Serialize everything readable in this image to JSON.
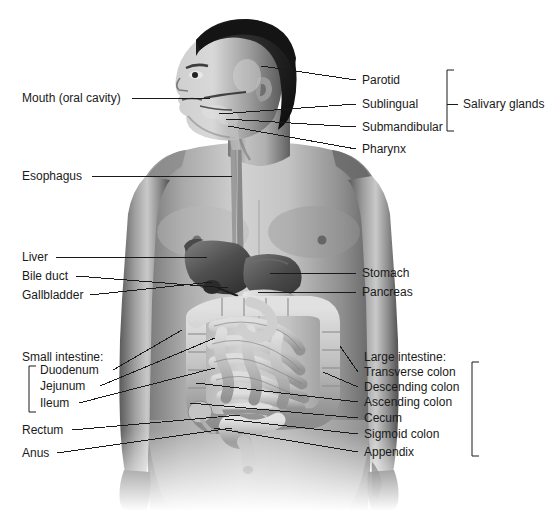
{
  "diagram": {
    "background_color": "#ffffff",
    "line_color": "#1a1a1a",
    "text_color": "#1a1a1a"
  },
  "labels_left": [
    {
      "id": "mouth",
      "text": "Mouth (oral cavity)",
      "x": 22,
      "y": 92,
      "line": {
        "x1": 132,
        "y1": 98,
        "x2": 210,
        "y2": 98
      }
    },
    {
      "id": "esophagus",
      "text": "Esophagus",
      "x": 22,
      "y": 170,
      "line": {
        "x1": 92,
        "y1": 176,
        "x2": 232,
        "y2": 176
      }
    },
    {
      "id": "liver",
      "text": "Liver",
      "x": 22,
      "y": 251,
      "line": {
        "x1": 56,
        "y1": 257,
        "x2": 207,
        "y2": 257
      }
    },
    {
      "id": "bile-duct",
      "text": "Bile duct",
      "x": 22,
      "y": 270,
      "line": {
        "x1": 76,
        "y1": 276,
        "x2": 228,
        "y2": 288
      }
    },
    {
      "id": "gallbladder",
      "text": "Gallbladder",
      "x": 22,
      "y": 289,
      "line": {
        "x1": 90,
        "y1": 295,
        "x2": 212,
        "y2": 282
      }
    },
    {
      "id": "rectum",
      "text": "Rectum",
      "x": 22,
      "y": 424,
      "line": {
        "x1": 72,
        "y1": 430,
        "x2": 240,
        "y2": 415
      }
    },
    {
      "id": "anus",
      "text": "Anus",
      "x": 22,
      "y": 447,
      "line": {
        "x1": 57,
        "y1": 453,
        "x2": 232,
        "y2": 428
      }
    }
  ],
  "small_intestine_group": {
    "heading": "Small intestine:",
    "heading_x": 22,
    "heading_y": 351,
    "bracket": {
      "x": 29,
      "y_top": 366,
      "y_bottom": 412,
      "arm": 7
    },
    "items": [
      {
        "id": "duodenum",
        "text": "Duodenum",
        "x": 40,
        "y": 364,
        "line": {
          "x1": 113,
          "y1": 370,
          "x2": 182,
          "y2": 330
        }
      },
      {
        "id": "jejunum",
        "text": "Jejunum",
        "x": 40,
        "y": 380,
        "line": {
          "x1": 100,
          "y1": 386,
          "x2": 215,
          "y2": 338
        }
      },
      {
        "id": "ileum",
        "text": "Ileum",
        "x": 40,
        "y": 397,
        "line": {
          "x1": 79,
          "y1": 403,
          "x2": 215,
          "y2": 368
        }
      }
    ]
  },
  "labels_right": [
    {
      "id": "parotid",
      "text": "Parotid",
      "x": 362,
      "y": 74,
      "line": {
        "x1": 356,
        "y1": 80,
        "x2": 261,
        "y2": 66
      }
    },
    {
      "id": "sublingual",
      "text": "Sublingual",
      "x": 362,
      "y": 98,
      "line": {
        "x1": 356,
        "y1": 104,
        "x2": 219,
        "y2": 114
      }
    },
    {
      "id": "submandibular",
      "text": "Submandibular",
      "x": 362,
      "y": 121,
      "line": {
        "x1": 356,
        "y1": 127,
        "x2": 226,
        "y2": 119
      }
    },
    {
      "id": "pharynx",
      "text": "Pharynx",
      "x": 362,
      "y": 143,
      "line": {
        "x1": 356,
        "y1": 149,
        "x2": 228,
        "y2": 126
      }
    },
    {
      "id": "stomach",
      "text": "Stomach",
      "x": 362,
      "y": 267,
      "line": {
        "x1": 356,
        "y1": 273,
        "x2": 270,
        "y2": 273
      }
    },
    {
      "id": "pancreas",
      "text": "Pancreas",
      "x": 362,
      "y": 286,
      "line": {
        "x1": 356,
        "y1": 292,
        "x2": 258,
        "y2": 292
      }
    }
  ],
  "large_intestine_group": {
    "heading": "Large intestine:",
    "heading_x": 364,
    "heading_y": 351,
    "bracket": {
      "x": 472,
      "y_top": 362,
      "y_bottom": 456,
      "arm": 7
    },
    "items": [
      {
        "id": "transverse-colon",
        "text": "Transverse colon",
        "x": 364,
        "y": 366,
        "line": {
          "x1": 358,
          "y1": 372,
          "x2": 340,
          "y2": 346
        }
      },
      {
        "id": "descending-colon",
        "text": "Descending colon",
        "x": 364,
        "y": 381,
        "line": {
          "x1": 358,
          "y1": 387,
          "x2": 323,
          "y2": 372
        }
      },
      {
        "id": "ascending-colon",
        "text": "Ascending colon",
        "x": 364,
        "y": 396,
        "line": {
          "x1": 358,
          "y1": 402,
          "x2": 196,
          "y2": 383
        }
      },
      {
        "id": "cecum",
        "text": "Cecum",
        "x": 364,
        "y": 412,
        "line": {
          "x1": 358,
          "y1": 418,
          "x2": 190,
          "y2": 403
        }
      },
      {
        "id": "sigmoid-colon",
        "text": "Sigmoid colon",
        "x": 364,
        "y": 428,
        "line": {
          "x1": 358,
          "y1": 434,
          "x2": 225,
          "y2": 419
        }
      },
      {
        "id": "appendix",
        "text": "Appendix",
        "x": 364,
        "y": 446,
        "line": {
          "x1": 358,
          "y1": 452,
          "x2": 214,
          "y2": 428
        }
      }
    ]
  },
  "salivary_glands_group": {
    "label": "Salivary glands",
    "label_x": 463,
    "label_y": 98,
    "bracket": {
      "x": 447,
      "y_top": 70,
      "y_bottom": 131,
      "arm": 7
    },
    "tick": {
      "x1": 447,
      "y1": 104,
      "x2": 458,
      "y2": 104
    }
  }
}
